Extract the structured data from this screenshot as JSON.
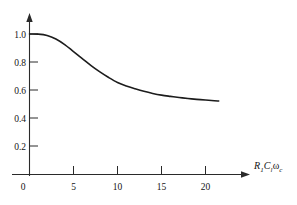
{
  "figure": {
    "background_color": "#ffffff",
    "axis_color": "#2a2a2a",
    "curve_color": "#1c1c1c"
  },
  "axis_labels": {
    "x_axis_label_parts": {
      "r": "R",
      "r_sub": "1",
      "c": "C",
      "c_sub": "l",
      "omega": "ω",
      "omega_sub": "c"
    },
    "x_axis_label_text": "R1Clωc"
  },
  "caption": {
    "partial_text": ""
  },
  "chart_data": {
    "type": "line",
    "title": "",
    "xlabel": "R₁Cₗωᴄ",
    "ylabel": "",
    "xlim": [
      0,
      24
    ],
    "ylim": [
      0,
      1.12
    ],
    "grid": false,
    "legend": false,
    "xticks": [
      0,
      5,
      10,
      15,
      20
    ],
    "xtick_labels": [
      "0",
      "5",
      "10",
      "15",
      "20"
    ],
    "yticks": [
      0.2,
      0.4,
      0.6,
      0.8,
      1.0
    ],
    "ytick_labels": [
      "0.2",
      "0.4",
      "0.6",
      "0.8",
      "1.0"
    ],
    "series": [
      {
        "name": "normalized response",
        "x": [
          0.0,
          1.0,
          2.0,
          3.0,
          4.0,
          5.0,
          6.0,
          7.0,
          8.0,
          9.0,
          10.0,
          11.0,
          12.0,
          13.0,
          14.0,
          15.0,
          16.0,
          17.0,
          18.0,
          19.0,
          20.0,
          21.0,
          21.5
        ],
        "y": [
          1.0,
          0.999,
          0.99,
          0.965,
          0.925,
          0.875,
          0.825,
          0.775,
          0.73,
          0.69,
          0.655,
          0.63,
          0.61,
          0.592,
          0.577,
          0.565,
          0.556,
          0.548,
          0.541,
          0.535,
          0.53,
          0.525,
          0.523
        ]
      }
    ]
  }
}
